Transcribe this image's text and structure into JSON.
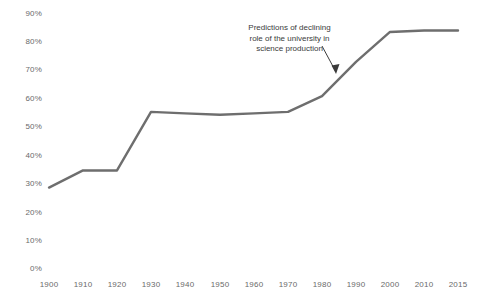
{
  "chart_data": {
    "type": "line",
    "title": "",
    "subtitle": "",
    "xlabel": "",
    "ylabel": "",
    "x": [
      1900,
      1910,
      1920,
      1930,
      1940,
      1950,
      1960,
      1970,
      1980,
      1990,
      2000,
      2010,
      2015
    ],
    "values": [
      28,
      34,
      34,
      54.5,
      54,
      53.5,
      54,
      54.5,
      60,
      72,
      82.5,
      83,
      83
    ],
    "series": [
      {
        "name": "University share of science production",
        "values": [
          28,
          34,
          34,
          54.5,
          54,
          53.5,
          54,
          54.5,
          60,
          72,
          82.5,
          83,
          83
        ]
      }
    ],
    "categories": [
      "1900",
      "1910",
      "1920",
      "1930",
      "1940",
      "1950",
      "1960",
      "1970",
      "1980",
      "1990",
      "2000",
      "2010",
      "2015"
    ],
    "xtick_labels": [
      "1900",
      "1910",
      "1920",
      "1930",
      "1940",
      "1950",
      "1960",
      "1970",
      "1980",
      "1990",
      "2000",
      "2010",
      "2015"
    ],
    "ytick_labels": [
      "0%",
      "10%",
      "20%",
      "30%",
      "40%",
      "50%",
      "60%",
      "70%",
      "80%",
      "90%"
    ],
    "ytick_values": [
      0,
      10,
      20,
      30,
      40,
      50,
      60,
      70,
      80,
      90
    ],
    "ylim": [
      0,
      90
    ],
    "xlim": [
      1900,
      2015
    ],
    "grid": false,
    "legend": "none",
    "line_color": "#6e6e6e",
    "text_color": "#6a6a6a",
    "background": "#ffffff",
    "annotations": [
      {
        "name": "predictions-annotation",
        "lines": [
          "Predictions of declining",
          "role of the university in",
          "science production"
        ],
        "text": "Predictions of declining role of the university in science production",
        "arrow": "down-right",
        "points_to_x": 1990,
        "points_to_y": 72
      }
    ]
  }
}
